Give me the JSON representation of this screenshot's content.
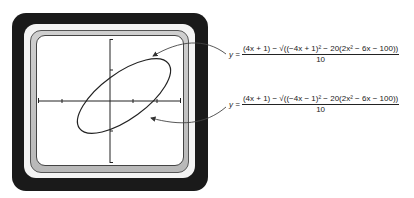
{
  "figure": {
    "device": "graphing-calculator-screen",
    "graph": {
      "shape": "tilted-ellipse",
      "x_axis_ticks": 6,
      "y_axis_ticks": 4
    },
    "equations": [
      {
        "lhs": "y =",
        "numerator": "(4x + 1) − √((−4x + 1)² − 20(2x² − 6x − 100))",
        "denominator": "10",
        "points_to": "upper half of ellipse"
      },
      {
        "lhs": "y =",
        "numerator": "(4x + 1) − √((−4x − 1)² − 20(2x² − 6x − 100))",
        "denominator": "10",
        "points_to": "lower half of ellipse"
      }
    ]
  }
}
